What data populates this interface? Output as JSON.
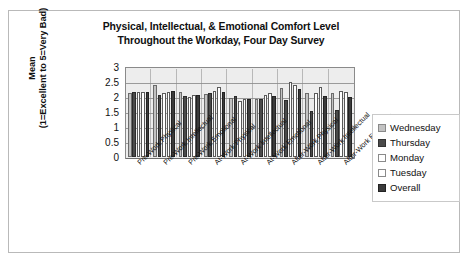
{
  "chart_data": {
    "type": "bar",
    "title": "Physical, Intellectual, & Emotional Comfort Level Throughout the Workday, Four Day Survey",
    "title_line1": "Physical, Intellectual, & Emotional Comfort Level",
    "title_line2": "Throughout the Workday, Four Day Survey",
    "xlabel": "",
    "ylabel": "Mean (1=Excellent to 5=Very Bad)",
    "ylabel_line1": "Mean",
    "ylabel_line2": "(1=Excellent to 5=Very Bad)",
    "ylim": [
      0,
      3
    ],
    "ytick_labels": [
      "3",
      "2.5",
      "2",
      "1.5",
      "1",
      "0.5",
      "0"
    ],
    "ytick_values": [
      3,
      2.5,
      2,
      1.5,
      1,
      0.5,
      0
    ],
    "grid": true,
    "legend_position": "right",
    "categories": [
      "Pre-Work Physical",
      "Pre-Work Intellectual",
      "Pre-Work Emotional",
      "At-Work Physical",
      "At-Work Intellectual",
      "At-Work Emotional",
      "After-Work Physical",
      "After-Work Intellectual",
      "After-Work Emotional"
    ],
    "series": [
      {
        "name": "Wednesday",
        "color": "#c2c2c2",
        "values": [
          2.15,
          2.4,
          2.17,
          2.1,
          1.98,
          1.95,
          2.3,
          2.15,
          2.13
        ]
      },
      {
        "name": "Thursday",
        "color": "#4a4a4a",
        "values": [
          2.17,
          2.08,
          2.05,
          2.13,
          2.02,
          1.95,
          1.9,
          1.53,
          1.58
        ]
      },
      {
        "name": "Monday",
        "color": "#ffffff",
        "values": [
          2.18,
          2.13,
          2.0,
          2.2,
          1.88,
          2.08,
          2.5,
          2.12,
          2.2
        ]
      },
      {
        "name": "Tuesday",
        "color": "#ffffff",
        "values": [
          2.17,
          2.18,
          2.07,
          2.32,
          1.95,
          2.12,
          2.4,
          2.32,
          2.17
        ]
      },
      {
        "name": "Overall",
        "color": "#3b3b3b",
        "values": [
          2.18,
          2.2,
          2.07,
          2.18,
          1.93,
          2.02,
          2.28,
          2.02,
          2.0
        ]
      }
    ]
  },
  "legend": {
    "items": [
      {
        "label": "Wednesday"
      },
      {
        "label": "Thursday"
      },
      {
        "label": "Monday"
      },
      {
        "label": "Tuesday"
      },
      {
        "label": "Overall"
      }
    ]
  }
}
